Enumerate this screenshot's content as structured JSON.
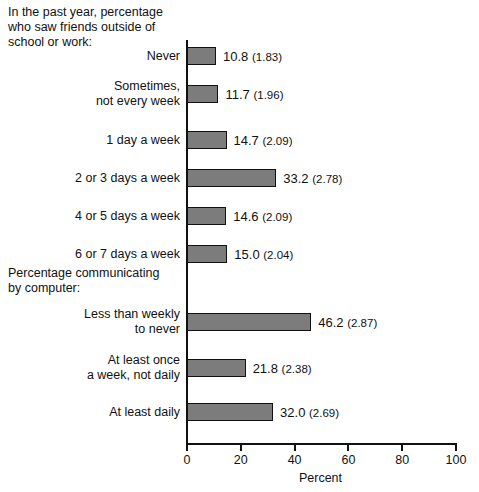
{
  "chart_data": {
    "type": "bar",
    "orientation": "horizontal",
    "title": "",
    "xlabel": "Percent",
    "ylabel": "",
    "xlim": [
      0,
      100
    ],
    "xticks": [
      0,
      20,
      40,
      60,
      80,
      100
    ],
    "xtick_labels": [
      "0",
      "20",
      "40",
      "60",
      "80",
      "100"
    ],
    "grid": false,
    "legend": null,
    "value_label_format": "value (standard_error)",
    "groups": [
      {
        "heading": "In the past year, percentage\nwho saw friends outside of\nschool or work:",
        "categories": [
          "Never",
          "Sometimes,\nnot every week",
          "1 day a week",
          "2 or 3 days a week",
          "4 or 5 days a week",
          "6 or 7 days a week"
        ],
        "values": [
          10.8,
          11.7,
          14.7,
          33.2,
          14.6,
          15.0
        ],
        "standard_errors": [
          1.83,
          1.96,
          2.09,
          2.78,
          2.09,
          2.04
        ],
        "value_labels": [
          "10.8 (1.83)",
          "11.7 (1.96)",
          "14.7 (2.09)",
          "33.2 (2.78)",
          "14.6 (2.09)",
          "15.0 (2.04)"
        ]
      },
      {
        "heading": "Percentage communicating\nby computer:",
        "categories": [
          "Less than weekly\nto never",
          "At least once\na week, not daily",
          "At least daily"
        ],
        "values": [
          46.2,
          21.8,
          32.0
        ],
        "standard_errors": [
          2.87,
          2.38,
          2.69
        ],
        "value_labels": [
          "46.2 (2.87)",
          "21.8 (2.38)",
          "32.0 (2.69)"
        ]
      }
    ]
  },
  "headings": {
    "friends": "In the past year, percentage\nwho saw friends outside of\nschool or work:",
    "computer": "Percentage communicating\nby computer:"
  },
  "axis": {
    "x_title": "Percent",
    "ticks": [
      "0",
      "20",
      "40",
      "60",
      "80",
      "100"
    ]
  },
  "bars": [
    {
      "label": "Never",
      "value": 10.8,
      "se": 1.83,
      "value_label": "10.8 (1.83)",
      "y": 7
    },
    {
      "label": "Sometimes,\nnot every week",
      "value": 11.7,
      "se": 1.96,
      "value_label": "11.7 (1.96)",
      "y": 45
    },
    {
      "label": "1 day a week",
      "value": 14.7,
      "se": 2.09,
      "value_label": "14.7 (2.09)",
      "y": 91
    },
    {
      "label": "2 or 3 days a week",
      "value": 33.2,
      "se": 2.78,
      "value_label": "33.2 (2.78)",
      "y": 129
    },
    {
      "label": "4 or 5 days a week",
      "value": 14.6,
      "se": 2.09,
      "value_label": "14.6 (2.09)",
      "y": 167
    },
    {
      "label": "6 or 7 days a week",
      "value": 15.0,
      "se": 2.04,
      "value_label": "15.0 (2.04)",
      "y": 205
    },
    {
      "label": "Less than weekly\nto never",
      "value": 46.2,
      "se": 2.87,
      "value_label": "46.2 (2.87)",
      "y": 273
    },
    {
      "label": "At least once\na week, not daily",
      "value": 21.8,
      "se": 2.38,
      "value_label": "21.8 (2.38)",
      "y": 319
    },
    {
      "label": "At least daily",
      "value": 32.0,
      "se": 2.69,
      "value_label": "32.0 (2.69)",
      "y": 363
    }
  ]
}
